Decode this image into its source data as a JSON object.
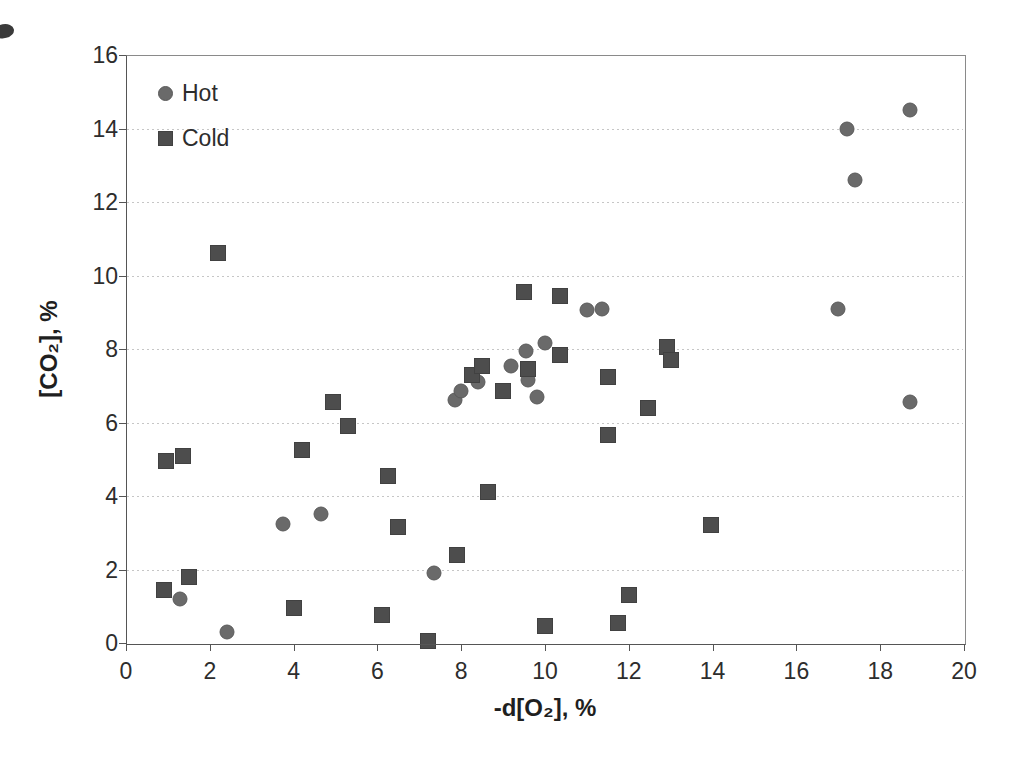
{
  "chart_data": {
    "type": "scatter",
    "title": "",
    "xlabel": "-d[O₂], %",
    "ylabel": "[CO₂], %",
    "xlim": [
      0,
      20
    ],
    "ylim": [
      0,
      16
    ],
    "x_ticks": [
      0,
      2,
      4,
      6,
      8,
      10,
      12,
      14,
      16,
      18,
      20
    ],
    "y_ticks": [
      0,
      2,
      4,
      6,
      8,
      10,
      12,
      14,
      16
    ],
    "grid": "horizontal dotted gridlines at every 2 units",
    "legend": {
      "position": "top-left-inside",
      "items": [
        {
          "label": "Hot",
          "marker": "circle"
        },
        {
          "label": "Cold",
          "marker": "square"
        }
      ]
    },
    "series": [
      {
        "name": "Hot",
        "marker": "circle",
        "color": "#6a6a6a",
        "points": [
          [
            1.3,
            1.2
          ],
          [
            2.4,
            0.3
          ],
          [
            3.75,
            3.25
          ],
          [
            4.65,
            3.5
          ],
          [
            7.35,
            1.9
          ],
          [
            7.85,
            6.6
          ],
          [
            8.0,
            6.85
          ],
          [
            8.4,
            7.1
          ],
          [
            9.2,
            7.55
          ],
          [
            9.55,
            7.95
          ],
          [
            9.6,
            7.15
          ],
          [
            9.8,
            6.7
          ],
          [
            10.0,
            8.15
          ],
          [
            11.0,
            9.05
          ],
          [
            11.35,
            9.1
          ],
          [
            17.0,
            9.1
          ],
          [
            17.2,
            14.0
          ],
          [
            17.4,
            12.6
          ],
          [
            18.7,
            14.5
          ],
          [
            18.7,
            6.55
          ]
        ]
      },
      {
        "name": "Cold",
        "marker": "square",
        "color": "#4d4d4d",
        "points": [
          [
            0.9,
            1.45
          ],
          [
            0.95,
            4.95
          ],
          [
            1.35,
            5.1
          ],
          [
            1.5,
            1.8
          ],
          [
            2.2,
            10.6
          ],
          [
            4.0,
            0.95
          ],
          [
            4.2,
            5.25
          ],
          [
            4.95,
            6.55
          ],
          [
            5.3,
            5.9
          ],
          [
            6.1,
            0.75
          ],
          [
            6.25,
            4.55
          ],
          [
            6.5,
            3.15
          ],
          [
            7.2,
            0.05
          ],
          [
            7.9,
            2.4
          ],
          [
            8.25,
            7.3
          ],
          [
            8.5,
            7.55
          ],
          [
            8.65,
            4.1
          ],
          [
            9.0,
            6.85
          ],
          [
            9.5,
            9.55
          ],
          [
            9.6,
            7.45
          ],
          [
            10.0,
            0.45
          ],
          [
            10.35,
            7.85
          ],
          [
            10.35,
            9.45
          ],
          [
            11.5,
            5.65
          ],
          [
            11.5,
            7.25
          ],
          [
            11.75,
            0.55
          ],
          [
            12.0,
            1.3
          ],
          [
            12.45,
            6.4
          ],
          [
            12.9,
            8.05
          ],
          [
            13.0,
            7.7
          ],
          [
            13.95,
            3.2
          ]
        ]
      }
    ]
  }
}
